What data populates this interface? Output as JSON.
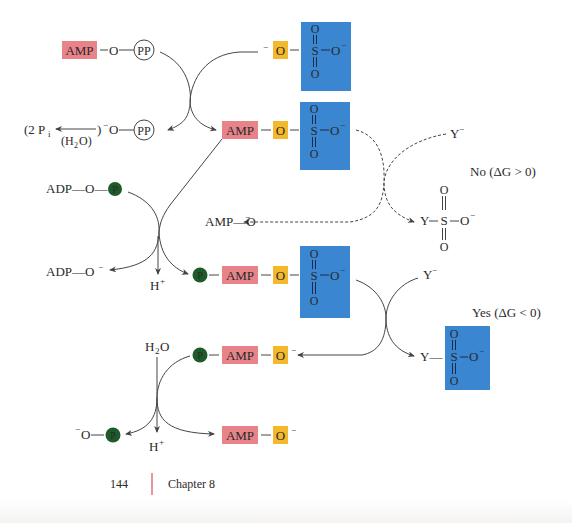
{
  "figure": {
    "colors": {
      "amp_box": "#e8838a",
      "o_box": "#f3b82c",
      "sulfate_box": "#3a86d1",
      "phosphate_circle": "#1e5a2a",
      "line": "#444444",
      "footer_rule": "#d0555a"
    },
    "row1": {
      "amp": "AMP",
      "link": "—O—",
      "pp": "PP",
      "o_minus_sup": "−",
      "o": "O",
      "sulfate": {
        "s": "S",
        "o_top": "O",
        "o_bottom": "O",
        "o_right": "O",
        "charge": "−"
      }
    },
    "row2": {
      "pi_open": "(2 P",
      "pi_sub": "i",
      "h2o": "(H",
      "h2o_sub": "2",
      "h2o_end": "O)",
      "close_paren": ")",
      "o_minus": "−O—",
      "pp": "PP",
      "amp": "AMP",
      "o": "O",
      "sulfate": {
        "s": "S",
        "o_top": "O",
        "o_bottom": "O",
        "o_right": "O",
        "charge": "−"
      }
    },
    "no_branch": {
      "y_minus": "Y",
      "y_charge": "−",
      "label": "No  (ΔG > 0)",
      "product": {
        "y": "Y",
        "s": "S",
        "o_top": "O",
        "o_bottom": "O",
        "o_right": "O",
        "charge": "−"
      },
      "amp_o": "AMP—O",
      "amp_o_charge": "−"
    },
    "adp_row": {
      "adp_o": "ADP—O—",
      "p": "P",
      "adp_o_minus": "ADP—O",
      "adp_charge": "−",
      "h_plus": "H",
      "h_charge": "+"
    },
    "row3": {
      "p": "P",
      "amp": "AMP",
      "o": "O",
      "sulfate": {
        "s": "S",
        "o_top": "O",
        "o_bottom": "O",
        "o_right": "O",
        "charge": "−"
      }
    },
    "yes_branch": {
      "y_minus": "Y",
      "y_charge": "−",
      "label": "Yes  (ΔG < 0)",
      "product": {
        "y": "Y—",
        "s": "S",
        "o_top": "O",
        "o_bottom": "O",
        "o_right": "O",
        "charge": "−"
      }
    },
    "row4": {
      "h2o": "H",
      "h2o_sub": "2",
      "h2o_end": "O",
      "p": "P",
      "amp": "AMP",
      "o": "O",
      "charge": "−"
    },
    "row5": {
      "o_minus": "−O—",
      "p": "P",
      "h_plus": "H",
      "h_charge": "+",
      "amp": "AMP",
      "o": "O",
      "charge": "−"
    }
  },
  "footer": {
    "page_number": "144",
    "chapter": "Chapter 8"
  }
}
